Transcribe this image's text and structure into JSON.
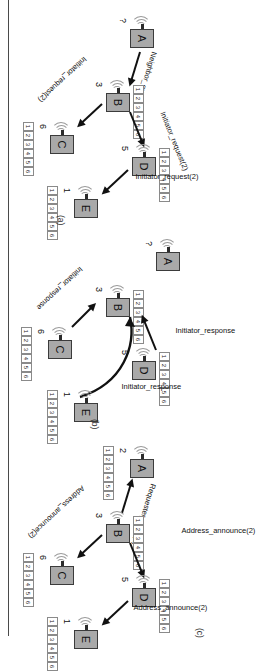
{
  "figure": {
    "caption_style": "three-panel wireless routing protocol sequence",
    "panels": [
      {
        "id": "a",
        "label": "(a)",
        "messages": [
          {
            "name": "neighbor-query",
            "text": "Neighbor_query"
          },
          {
            "name": "initiator-request-b-d",
            "text": "Initiator_request(2)"
          },
          {
            "name": "initiator-request-b-c",
            "text": "Initiator_request(2)"
          },
          {
            "name": "initiator-request-d-e",
            "text": "Initiator_request(2)"
          }
        ],
        "nodes": [
          {
            "name": "node-a",
            "letter": "A",
            "id": "?",
            "table": null
          },
          {
            "name": "node-b",
            "letter": "B",
            "id": "3",
            "table": [
              "1",
              "2",
              "3",
              "4",
              "5",
              "6"
            ]
          },
          {
            "name": "node-c",
            "letter": "C",
            "id": "6",
            "table": [
              "1",
              "2",
              "3",
              "4",
              "5",
              "6"
            ]
          },
          {
            "name": "node-d",
            "letter": "D",
            "id": "5",
            "table": [
              "1",
              "2",
              "3",
              "4",
              "5",
              "6"
            ]
          },
          {
            "name": "node-e",
            "letter": "E",
            "id": "1",
            "table": [
              "1",
              "2",
              "3",
              "4",
              "5",
              "6"
            ]
          }
        ]
      },
      {
        "id": "b",
        "label": "(b)",
        "messages": [
          {
            "name": "initiator-response-d-b",
            "text": "Initiator_response"
          },
          {
            "name": "initiator-response-c-b",
            "text": "Initiator_response"
          },
          {
            "name": "initiator-response-e-b",
            "text": "Initiator_response"
          }
        ],
        "nodes": [
          {
            "name": "node-a",
            "letter": "A",
            "id": "?",
            "table": null
          },
          {
            "name": "node-b",
            "letter": "B",
            "id": "3",
            "table": [
              "1",
              "2",
              "3",
              "4",
              "5",
              "6"
            ]
          },
          {
            "name": "node-c",
            "letter": "C",
            "id": "6",
            "table": [
              "1",
              "2",
              "3",
              "4",
              "5",
              "6"
            ]
          },
          {
            "name": "node-d",
            "letter": "D",
            "id": "5",
            "table": [
              "1",
              "2",
              "3",
              "4",
              "5",
              "6"
            ]
          },
          {
            "name": "node-e",
            "letter": "E",
            "id": "1",
            "table": [
              "1",
              "2",
              "3",
              "4",
              "5",
              "6"
            ]
          }
        ]
      },
      {
        "id": "c",
        "label": "(c)",
        "messages": [
          {
            "name": "requester-reply",
            "text": "Requester_reply(2)"
          },
          {
            "name": "address-announce-b-d",
            "text": "Address_announce(2)"
          },
          {
            "name": "address-announce-b-c",
            "text": "Address_announce(2)"
          },
          {
            "name": "address-announce-d-e",
            "text": "Address_announce(2)"
          }
        ],
        "nodes": [
          {
            "name": "node-a",
            "letter": "A",
            "id": "2",
            "table": [
              "1",
              "2",
              "3",
              "4",
              "5",
              "6"
            ]
          },
          {
            "name": "node-b",
            "letter": "B",
            "id": "3",
            "table": [
              "1",
              "2",
              "3",
              "4",
              "5",
              "6"
            ]
          },
          {
            "name": "node-c",
            "letter": "C",
            "id": "6",
            "table": [
              "1",
              "2",
              "3",
              "4",
              "5",
              "6"
            ]
          },
          {
            "name": "node-d",
            "letter": "D",
            "id": "5",
            "table": [
              "1",
              "2",
              "3",
              "4",
              "5",
              "6"
            ]
          },
          {
            "name": "node-e",
            "letter": "E",
            "id": "1",
            "table": [
              "1",
              "2",
              "3",
              "4",
              "5",
              "6"
            ]
          }
        ]
      }
    ],
    "colors": {
      "node_fill": "#a9a9a9",
      "node_stroke": "#3b3b3b",
      "arrow": "#111111",
      "table_stroke": "#8a8a8a",
      "rule": "#4a4a4a"
    }
  }
}
